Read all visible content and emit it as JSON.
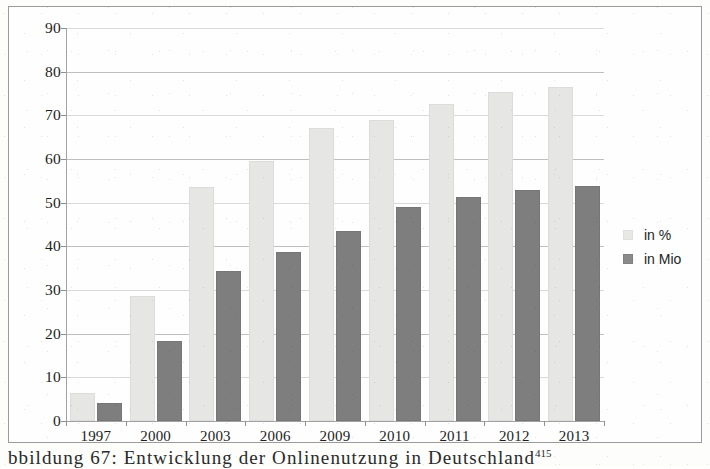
{
  "chart_data": {
    "type": "bar",
    "title": "",
    "xlabel": "",
    "ylabel": "",
    "ylim": [
      0,
      90
    ],
    "ytick_step": 10,
    "yticks": [
      0,
      10,
      20,
      30,
      40,
      50,
      60,
      70,
      80,
      90
    ],
    "grid": true,
    "legend_position": "right",
    "categories": [
      "1997",
      "2000",
      "2003",
      "2006",
      "2009",
      "2010",
      "2011",
      "2012",
      "2013"
    ],
    "series": [
      {
        "name": "in %",
        "color": "#e6e6e4",
        "values": [
          6.5,
          28.6,
          53.5,
          59.5,
          67.1,
          69.0,
          72.7,
          75.3,
          76.5
        ]
      },
      {
        "name": "in Mio",
        "color": "#7e7e7e",
        "values": [
          4.1,
          18.3,
          34.4,
          38.6,
          43.5,
          49.0,
          51.2,
          53.0,
          53.8
        ]
      }
    ]
  },
  "legend": {
    "items": [
      {
        "label": "in %",
        "swatch": "pct"
      },
      {
        "label": "in Mio",
        "swatch": "mio"
      }
    ]
  },
  "caption": {
    "text": "bbildung 67: Entwicklung der Onlinenutzung in Deutschland",
    "footnote": "415"
  },
  "colors": {
    "series_pct": "#e6e6e4",
    "series_mio": "#7e7e7e",
    "gridline": "#d9d9d9",
    "axis": "#a2a2a2",
    "frame": "#9b9b9b",
    "text": "#1d1d1d"
  }
}
